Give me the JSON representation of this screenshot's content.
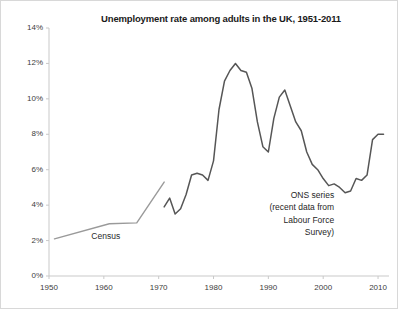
{
  "chart_data": {
    "type": "line",
    "title": "Unemployment rate among adults in the UK, 1951-2011",
    "xlabel": "",
    "ylabel": "",
    "xlim": [
      1950,
      2012
    ],
    "ylim": [
      0,
      14
    ],
    "grid": false,
    "legend_position": "none",
    "x_ticks": [
      "1950",
      "1960",
      "1970",
      "1980",
      "1990",
      "2000",
      "2010"
    ],
    "y_ticks": [
      "0%",
      "2%",
      "4%",
      "6%",
      "8%",
      "10%",
      "12%",
      "14%"
    ],
    "annotations": [
      {
        "name": "census-label",
        "text": "Census",
        "x": 1961,
        "y": 2.2
      },
      {
        "name": "ons-annotation",
        "lines": [
          "ONS series",
          "(recent data from",
          "Labour Force",
          "Survey)"
        ],
        "x": 2002,
        "y": 4.6
      }
    ],
    "series": [
      {
        "name": "Census",
        "color": "#9a9a9a",
        "x": [
          1951,
          1961,
          1966,
          1971
        ],
        "values": [
          2.1,
          2.95,
          3.0,
          5.3
        ]
      },
      {
        "name": "ONS series",
        "color": "#565656",
        "x": [
          1971,
          1972,
          1973,
          1974,
          1975,
          1976,
          1977,
          1978,
          1979,
          1980,
          1981,
          1982,
          1983,
          1984,
          1985,
          1986,
          1987,
          1988,
          1989,
          1990,
          1991,
          1992,
          1993,
          1994,
          1995,
          1996,
          1997,
          1998,
          1999,
          2000,
          2001,
          2002,
          2003,
          2004,
          2005,
          2006,
          2007,
          2008,
          2009,
          2010,
          2011
        ],
        "values": [
          3.9,
          4.4,
          3.5,
          3.8,
          4.6,
          5.7,
          5.8,
          5.7,
          5.4,
          6.5,
          9.4,
          11.0,
          11.6,
          12.0,
          11.6,
          11.5,
          10.6,
          8.7,
          7.3,
          7.0,
          8.9,
          10.1,
          10.5,
          9.6,
          8.7,
          8.2,
          7.0,
          6.3,
          6.0,
          5.5,
          5.1,
          5.2,
          5.0,
          4.7,
          4.8,
          5.5,
          5.4,
          5.7,
          7.7,
          8.0,
          8.0
        ]
      }
    ]
  }
}
